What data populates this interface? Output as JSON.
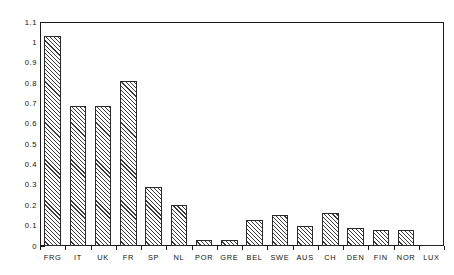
{
  "chart_data": {
    "type": "bar",
    "title": "",
    "subtitle": "",
    "xlabel": "",
    "ylabel": "",
    "categories": [
      "FRG",
      "IT",
      "UK",
      "FR",
      "SP",
      "NL",
      "POR",
      "GRE",
      "BEL",
      "SWE",
      "AUS",
      "CH",
      "DEN",
      "FIN",
      "NOR",
      "LUX"
    ],
    "values": [
      1.03,
      0.69,
      0.69,
      0.81,
      0.29,
      0.2,
      0.03,
      0.03,
      0.13,
      0.15,
      0.1,
      0.16,
      0.09,
      0.08,
      0.08,
      0.005
    ],
    "ylim": [
      0,
      1.1
    ],
    "xlim_categories": 16,
    "ytick_labels": [
      "1.1",
      "1",
      "0.9",
      "0.8",
      "0.7",
      "0.6",
      "0.5",
      "0.4",
      "0.3",
      "0.2",
      "0.1",
      "0"
    ],
    "ytick_values": [
      1.1,
      1.0,
      0.9,
      0.8,
      0.7,
      0.6,
      0.5,
      0.4,
      0.3,
      0.2,
      0.1,
      0.0
    ],
    "grid": false,
    "legend": [],
    "legend_position": "none",
    "annotations": [],
    "bar_fill": "diagonal-hatch",
    "bar_edge_color": "#2a2a2a",
    "background_color": "#ffffff",
    "axis_color": "#1a1a1a"
  }
}
